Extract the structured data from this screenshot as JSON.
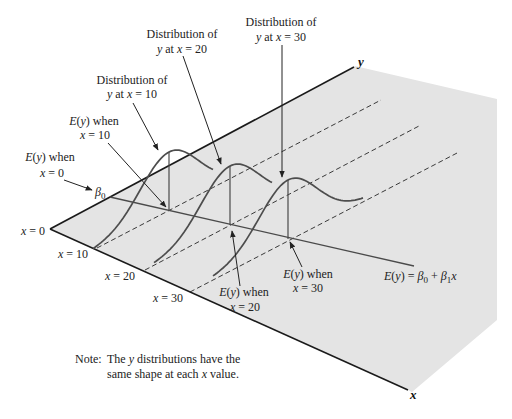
{
  "figure": {
    "colors": {
      "plane": "#e4e4e4",
      "axis": "#1a1a1a",
      "curve": "#4d4d4d",
      "text": "#222222"
    },
    "x_values_shown": [
      0,
      10,
      20,
      30
    ]
  },
  "axes": {
    "x_label": "x",
    "y_label": "y"
  },
  "x_ticks": [
    {
      "var": "x",
      "eq": " = 0"
    },
    {
      "var": "x",
      "eq": " = 10"
    },
    {
      "var": "x",
      "eq": " = 20"
    },
    {
      "var": "x",
      "eq": " = 30"
    }
  ],
  "labels": {
    "dist_x10": {
      "line1": "Distribution of",
      "var_y": "y",
      "mid": " at ",
      "var_x": "x",
      "eq": " = 10"
    },
    "dist_x20": {
      "line1": "Distribution of",
      "var_y": "y",
      "mid": " at ",
      "var_x": "x",
      "eq": " = 20"
    },
    "dist_x30": {
      "line1": "Distribution of",
      "var_y": "y",
      "mid": " at ",
      "var_x": "x",
      "eq": " = 30"
    },
    "ey_x0": {
      "fn": "E",
      "open": "(",
      "var": "y",
      "close_when": ") when",
      "var_x": "x",
      "eq": " = 0"
    },
    "ey_x10": {
      "fn": "E",
      "open": "(",
      "var": "y",
      "close_when": ") when",
      "var_x": "x",
      "eq": " = 10"
    },
    "ey_x20": {
      "fn": "E",
      "open": "(",
      "var": "y",
      "close_when": ") when",
      "var_x": "x",
      "eq": " = 20"
    },
    "ey_x30": {
      "fn": "E",
      "open": "(",
      "var": "y",
      "close_when": ") when",
      "var_x": "x",
      "eq": " = 30"
    },
    "beta0": {
      "sym": "β",
      "sub": "0"
    },
    "equation": {
      "fn": "E",
      "open": "(",
      "var": "y",
      "close_eq": ") = ",
      "b0": "β",
      "b0_sub": "0",
      "plus": " + ",
      "b1": "β",
      "b1_sub": "1",
      "var_x": "x"
    },
    "note": {
      "prefix": "Note:",
      "line1_a": "The ",
      "line1_var": "y",
      "line1_b": " distributions have the",
      "line2_a": "same shape at each ",
      "line2_var": "x",
      "line2_b": " value."
    }
  }
}
